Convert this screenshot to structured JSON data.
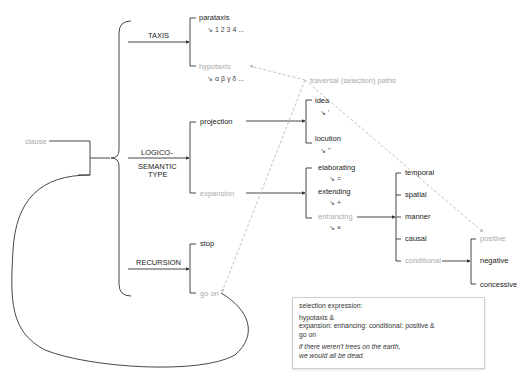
{
  "root": {
    "label": "clause"
  },
  "systems": {
    "taxis": {
      "label": "TAXIS",
      "options": [
        {
          "label": "parataxis",
          "notation": "↘ 1 2 3 4 ...",
          "selected": false
        },
        {
          "label": "hypotaxis",
          "notation": "↘ α β γ δ ...",
          "selected": true
        }
      ]
    },
    "logico_semantic": {
      "label_line1": "LOGICO-",
      "label_line2": "SEMANTIC",
      "label_line3": "TYPE",
      "options": [
        {
          "label": "projection",
          "selected": false
        },
        {
          "label": "expansion",
          "selected": true
        }
      ]
    },
    "projection": {
      "options": [
        {
          "label": "idea",
          "notation": "↘ '"
        },
        {
          "label": "locution",
          "notation": "↘ \""
        }
      ]
    },
    "expansion": {
      "options": [
        {
          "label": "elaborating",
          "notation": "↘ =",
          "selected": false
        },
        {
          "label": "extending",
          "notation": "↘ +",
          "selected": false
        },
        {
          "label": "enhancing",
          "notation": "↘ ×",
          "selected": true
        }
      ]
    },
    "enhancing": {
      "options": [
        {
          "label": "temporal",
          "selected": false
        },
        {
          "label": "spatial",
          "selected": false
        },
        {
          "label": "manner",
          "selected": false
        },
        {
          "label": "causal",
          "selected": false
        },
        {
          "label": "conditional",
          "selected": true
        }
      ]
    },
    "conditional": {
      "options": [
        {
          "label": "positive",
          "selected": true
        },
        {
          "label": "negative",
          "selected": false
        },
        {
          "label": "concessive",
          "selected": false
        }
      ]
    },
    "recursion": {
      "label": "RECURSION",
      "options": [
        {
          "label": "stop",
          "selected": false
        },
        {
          "label": "go on",
          "selected": true
        }
      ]
    }
  },
  "annotation": {
    "label": "traversal (selection) paths"
  },
  "note": {
    "title": "selection expression:",
    "line1": "hypotaxis &",
    "line2": "expansion: enhancing: conditional: positive &",
    "line3": "go on",
    "example1": "if there weren't trees on the earth,",
    "example2": "we would all be dead."
  },
  "colors": {
    "line": "#333333",
    "selected_text": "#aaaaaa",
    "dashed_path": "#bbbbbb"
  }
}
